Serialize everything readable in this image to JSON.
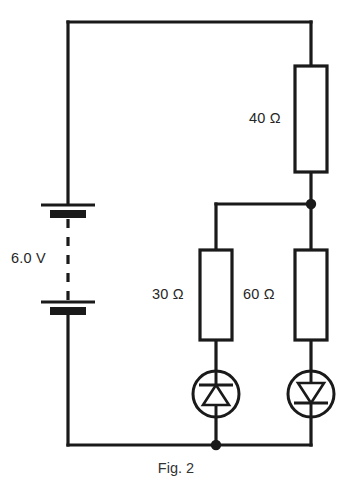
{
  "figure": {
    "caption": "Fig. 2",
    "title": "Fig. 2"
  },
  "labels": {
    "battery_voltage": "6.0 V",
    "resistor_top_right": "40 Ω",
    "resistor_middle": "30 Ω",
    "resistor_right": "60 Ω"
  },
  "components": [
    {
      "id": "battery",
      "name": "battery",
      "type": "battery-2-cell",
      "label": "6.0 V",
      "orientation": "vertical",
      "cells": 2
    },
    {
      "id": "resistor-40",
      "name": "resistor-40-ohm",
      "type": "resistor",
      "label": "40 Ω",
      "value": 40,
      "unit": "Ω",
      "orientation": "vertical"
    },
    {
      "id": "resistor-30",
      "name": "resistor-30-ohm",
      "type": "resistor",
      "label": "30 Ω",
      "value": 30,
      "unit": "Ω",
      "orientation": "vertical"
    },
    {
      "id": "resistor-60",
      "name": "resistor-60-ohm",
      "type": "resistor",
      "label": "60 Ω",
      "value": 60,
      "unit": "Ω",
      "orientation": "vertical"
    },
    {
      "id": "diode-left",
      "name": "diode-in-circle-left",
      "type": "diode",
      "label": "",
      "triangle_direction": "up",
      "bar_position": "above-triangle",
      "enclosed_in_circle": true
    },
    {
      "id": "diode-right",
      "name": "diode-in-circle-right",
      "type": "diode",
      "label": "",
      "triangle_direction": "down",
      "bar_position": "below-triangle",
      "enclosed_in_circle": true
    }
  ],
  "nodes": [
    {
      "id": "node-top-right-branch",
      "name": "junction-dot-upper"
    },
    {
      "id": "node-bottom-center",
      "name": "junction-dot-lower"
    }
  ],
  "colors": {
    "ink": "#1a1a1a",
    "text": "#262626",
    "caption": "#333333",
    "background": "#ffffff"
  }
}
